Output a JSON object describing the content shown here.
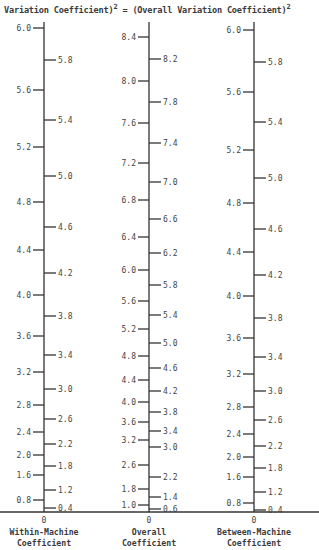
{
  "title": {
    "left": "Variation Coefficient)",
    "left_exp": "2",
    "equals": " = ",
    "right": "(Overall Variation Coefficient)",
    "right_exp": "2"
  },
  "chart_data": {
    "type": "nomograph",
    "baseline_zero": "0",
    "axes": [
      {
        "name": "Within-Machine Coefficient",
        "name_lines": [
          "Within-Machine",
          "Coefficient"
        ],
        "x": 44,
        "top": 22,
        "left_ticks": [
          {
            "label": "6.0",
            "y": 28
          },
          {
            "label": "5.6",
            "y": 90
          },
          {
            "label": "5.2",
            "y": 147
          },
          {
            "label": "4.8",
            "y": 202
          },
          {
            "label": "4.4",
            "y": 250
          },
          {
            "label": "4.0",
            "y": 295
          },
          {
            "label": "3.6",
            "y": 336
          },
          {
            "label": "3.2",
            "y": 372
          },
          {
            "label": "2.8",
            "y": 405
          },
          {
            "label": "2.4",
            "y": 432
          },
          {
            "label": "2.0",
            "y": 455
          },
          {
            "label": "1.6",
            "y": 475
          },
          {
            "label": "0.8",
            "y": 500
          }
        ],
        "right_ticks": [
          {
            "label": "5.8",
            "y": 60
          },
          {
            "label": "5.4",
            "y": 120
          },
          {
            "label": "5.0",
            "y": 176
          },
          {
            "label": "4.6",
            "y": 227
          },
          {
            "label": "4.2",
            "y": 273
          },
          {
            "label": "3.8",
            "y": 316
          },
          {
            "label": "3.4",
            "y": 355
          },
          {
            "label": "3.0",
            "y": 389
          },
          {
            "label": "2.6",
            "y": 419
          },
          {
            "label": "2.2",
            "y": 444
          },
          {
            "label": "1.8",
            "y": 466
          },
          {
            "label": "1.2",
            "y": 490
          },
          {
            "label": "0.4",
            "y": 508
          }
        ]
      },
      {
        "name": "Overall Coefficient",
        "name_lines": [
          "Overall",
          "Coefficient"
        ],
        "x": 149,
        "top": 22,
        "left_ticks": [
          {
            "label": "8.4",
            "y": 37
          },
          {
            "label": "8.0",
            "y": 81
          },
          {
            "label": "7.6",
            "y": 123
          },
          {
            "label": "7.2",
            "y": 163
          },
          {
            "label": "6.8",
            "y": 200
          },
          {
            "label": "6.4",
            "y": 237
          },
          {
            "label": "6.0",
            "y": 270
          },
          {
            "label": "5.6",
            "y": 301
          },
          {
            "label": "5.2",
            "y": 329
          },
          {
            "label": "4.8",
            "y": 356
          },
          {
            "label": "4.4",
            "y": 380
          },
          {
            "label": "4.0",
            "y": 402
          },
          {
            "label": "3.6",
            "y": 422
          },
          {
            "label": "3.2",
            "y": 440
          },
          {
            "label": "2.6",
            "y": 465
          },
          {
            "label": "1.8",
            "y": 489
          },
          {
            "label": "1.0",
            "y": 505
          }
        ],
        "right_ticks": [
          {
            "label": "8.2",
            "y": 59
          },
          {
            "label": "7.8",
            "y": 102
          },
          {
            "label": "7.4",
            "y": 143
          },
          {
            "label": "7.0",
            "y": 182
          },
          {
            "label": "6.6",
            "y": 219
          },
          {
            "label": "6.2",
            "y": 253
          },
          {
            "label": "5.8",
            "y": 285
          },
          {
            "label": "5.4",
            "y": 315
          },
          {
            "label": "5.0",
            "y": 343
          },
          {
            "label": "4.6",
            "y": 368
          },
          {
            "label": "4.2",
            "y": 391
          },
          {
            "label": "3.8",
            "y": 412
          },
          {
            "label": "3.4",
            "y": 431
          },
          {
            "label": "3.0",
            "y": 447
          },
          {
            "label": "2.2",
            "y": 477
          },
          {
            "label": "1.4",
            "y": 497
          },
          {
            "label": "0.6",
            "y": 509
          }
        ]
      },
      {
        "name": "Between-Machine Coefficient",
        "name_lines": [
          "Between-Machine",
          "Coefficient"
        ],
        "x": 254,
        "top": 22,
        "left_ticks": [
          {
            "label": "6.0",
            "y": 30
          },
          {
            "label": "5.6",
            "y": 92
          },
          {
            "label": "5.2",
            "y": 150
          },
          {
            "label": "4.8",
            "y": 203
          },
          {
            "label": "4.4",
            "y": 252
          },
          {
            "label": "4.0",
            "y": 296
          },
          {
            "label": "3.6",
            "y": 338
          },
          {
            "label": "3.2",
            "y": 374
          },
          {
            "label": "2.8",
            "y": 407
          },
          {
            "label": "2.4",
            "y": 434
          },
          {
            "label": "2.0",
            "y": 457
          },
          {
            "label": "1.6",
            "y": 477
          },
          {
            "label": "0.8",
            "y": 503
          }
        ],
        "right_ticks": [
          {
            "label": "5.8",
            "y": 62
          },
          {
            "label": "5.4",
            "y": 122
          },
          {
            "label": "5.0",
            "y": 178
          },
          {
            "label": "4.6",
            "y": 229
          },
          {
            "label": "4.2",
            "y": 275
          },
          {
            "label": "3.8",
            "y": 318
          },
          {
            "label": "3.4",
            "y": 357
          },
          {
            "label": "3.0",
            "y": 391
          },
          {
            "label": "2.6",
            "y": 420
          },
          {
            "label": "2.2",
            "y": 446
          },
          {
            "label": "1.8",
            "y": 468
          },
          {
            "label": "1.2",
            "y": 492
          },
          {
            "label": "0.4",
            "y": 510
          }
        ]
      }
    ],
    "baseline_y": 512,
    "grid": false,
    "legend": "none"
  }
}
